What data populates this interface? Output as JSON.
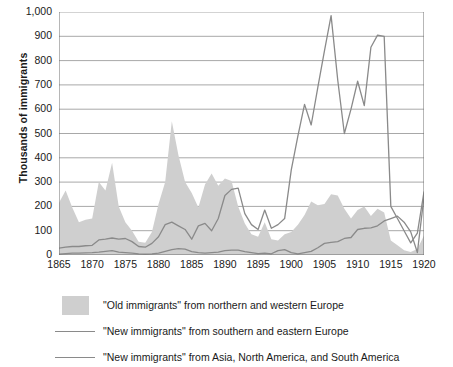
{
  "chart_data": {
    "type": "area",
    "title": "",
    "subtitle": "",
    "xlabel": "",
    "ylabel": "Thousands of immigrants",
    "xlim": [
      1865,
      1920
    ],
    "ylim": [
      0,
      1000
    ],
    "grid": true,
    "legend_position": "bottom",
    "y_ticks": [
      0,
      100,
      200,
      300,
      400,
      500,
      600,
      700,
      800,
      900,
      1000
    ],
    "y_tick_labels": [
      "0",
      "100",
      "200",
      "300",
      "400",
      "500",
      "600",
      "700",
      "800",
      "900",
      "1,000"
    ],
    "x_ticks": [
      1865,
      1870,
      1875,
      1880,
      1885,
      1890,
      1895,
      1900,
      1905,
      1910,
      1915,
      1920
    ],
    "x_tick_labels": [
      "1865",
      "1870",
      "1875",
      "1880",
      "1885",
      "1890",
      "1895",
      "1900",
      "1905",
      "1910",
      "1915",
      "1920"
    ],
    "x": [
      1865,
      1866,
      1867,
      1868,
      1869,
      1870,
      1871,
      1872,
      1873,
      1874,
      1875,
      1876,
      1877,
      1878,
      1879,
      1880,
      1881,
      1882,
      1883,
      1884,
      1885,
      1886,
      1887,
      1888,
      1889,
      1890,
      1891,
      1892,
      1893,
      1894,
      1895,
      1896,
      1897,
      1898,
      1899,
      1900,
      1901,
      1902,
      1903,
      1904,
      1905,
      1906,
      1907,
      1908,
      1909,
      1910,
      1911,
      1912,
      1913,
      1914,
      1915,
      1916,
      1917,
      1918,
      1919,
      1920
    ],
    "series": [
      {
        "name": "\"Old immigrants\" from northern and western Europe",
        "kind": "area",
        "color": "#cfcfcf",
        "values": [
          215,
          265,
          195,
          135,
          145,
          150,
          300,
          265,
          380,
          200,
          135,
          100,
          55,
          50,
          95,
          210,
          300,
          550,
          410,
          300,
          255,
          195,
          290,
          335,
          285,
          315,
          305,
          200,
          130,
          85,
          75,
          135,
          65,
          60,
          85,
          95,
          125,
          165,
          220,
          205,
          210,
          250,
          245,
          190,
          150,
          185,
          200,
          160,
          190,
          175,
          60,
          40,
          20,
          12,
          25,
          80
        ]
      },
      {
        "name": "\"New immigrants\" from southern and eastern Europe",
        "kind": "line",
        "color": "#8a8a8a",
        "values": [
          28,
          32,
          35,
          35,
          38,
          40,
          62,
          65,
          70,
          65,
          68,
          55,
          35,
          32,
          48,
          75,
          125,
          135,
          120,
          105,
          65,
          120,
          130,
          100,
          150,
          245,
          270,
          275,
          170,
          125,
          105,
          185,
          110,
          125,
          150,
          350,
          490,
          620,
          535,
          690,
          840,
          985,
          720,
          500,
          600,
          715,
          615,
          855,
          905,
          900,
          200,
          150,
          100,
          50,
          90,
          260
        ]
      },
      {
        "name": "\"New immigrants\" from Asia, North America, and South America",
        "kind": "line",
        "color": "#8a8a8a",
        "values": [
          4,
          6,
          8,
          8,
          9,
          10,
          12,
          15,
          18,
          12,
          10,
          8,
          5,
          4,
          5,
          8,
          15,
          22,
          26,
          24,
          14,
          10,
          8,
          10,
          12,
          18,
          20,
          20,
          14,
          10,
          6,
          8,
          5,
          18,
          22,
          10,
          5,
          10,
          15,
          30,
          48,
          52,
          55,
          68,
          72,
          105,
          110,
          112,
          120,
          140,
          150,
          160,
          135,
          95,
          10,
          240
        ]
      }
    ]
  },
  "legend": {
    "items": [
      {
        "marker": "area-swatch",
        "label": "\"Old immigrants\" from northern and western Europe"
      },
      {
        "marker": "line-swatch",
        "label": "\"New immigrants\" from southern and eastern Europe"
      },
      {
        "marker": "line-swatch",
        "label": "\"New immigrants\" from Asia, North America, and South America"
      }
    ]
  },
  "colors": {
    "area_fill": "#cfcfcf",
    "line": "#8a8a8a",
    "grid": "#a8a8a8",
    "axis": "#6e6e6e",
    "text": "#1a1a1a"
  }
}
